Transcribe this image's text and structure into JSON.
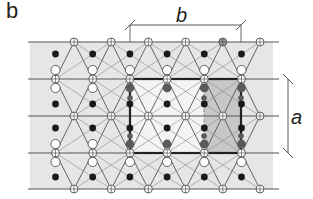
{
  "figure": {
    "panel_label": "b",
    "dimension_labels": {
      "horizontal": "b",
      "vertical": "a"
    },
    "colors": {
      "background_band": "#e6e6e6",
      "line": "#555555",
      "bold_line": "#222222",
      "dark_dot": "#1a1a1a",
      "gray_dot": "#5a5a5a",
      "open_circle_fill": "#ffffff",
      "shaded_cell": "#b8b8b8"
    },
    "legend_symbols": [
      "crossed-circle-node",
      "open-circle",
      "filled-dot",
      "gray-filled-dot"
    ]
  }
}
